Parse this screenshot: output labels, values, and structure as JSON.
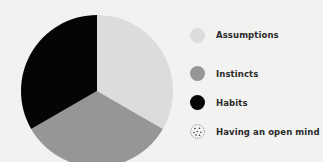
{
  "chart_data": {
    "type": "pie",
    "title": "",
    "categories": [
      "Assumptions",
      "Instincts",
      "Habits",
      "Having an open mind"
    ],
    "values": [
      33.3,
      33.3,
      33.3,
      0
    ],
    "colors": [
      "#dcdcdc",
      "#969696",
      "#050505",
      "#f6f6f6"
    ],
    "start_angle_deg": 0,
    "direction": "clockwise",
    "legend_position": "right"
  },
  "legend": {
    "items": [
      {
        "label": "Assumptions",
        "color": "#dcdcdc",
        "pattern": "solid"
      },
      {
        "label": "Instincts",
        "color": "#969696",
        "pattern": "solid"
      },
      {
        "label": "Habits",
        "color": "#050505",
        "pattern": "solid"
      },
      {
        "label": "Having an open mind",
        "color": "#f6f6f6",
        "pattern": "dotted"
      }
    ]
  }
}
